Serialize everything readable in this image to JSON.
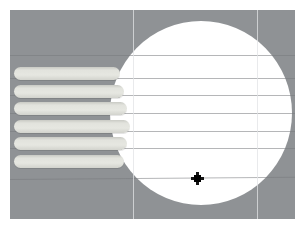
{
  "app": {
    "title": "3D Modeling Viewport",
    "view_label": "Front"
  },
  "viewport": {
    "background_color": "#8f9295",
    "surface_color": "#ffffff",
    "width": 303,
    "height": 228
  },
  "model": {
    "name": "cylindrical-body-with-ribs",
    "body": {
      "name": "circular-face",
      "shape": "circle",
      "fill_color": "#ffffff",
      "center_x": 201,
      "center_y": 113,
      "radius": 91
    },
    "ribs": [
      {
        "label": "rib-1",
        "x": 14,
        "y": 67,
        "width": 106,
        "shadow_width": 0
      },
      {
        "label": "rib-2",
        "x": 14,
        "y": 85,
        "width": 110,
        "shadow_width": 10
      },
      {
        "label": "rib-3",
        "x": 14,
        "y": 102,
        "width": 113,
        "shadow_width": 20
      },
      {
        "label": "rib-4",
        "x": 14,
        "y": 120,
        "width": 116,
        "shadow_width": 30
      },
      {
        "label": "rib-5",
        "x": 14,
        "y": 137,
        "width": 113,
        "shadow_width": 22
      },
      {
        "label": "rib-6",
        "x": 14,
        "y": 155,
        "width": 110,
        "shadow_width": 12
      }
    ],
    "rib_fill_color": "#e4e5df",
    "rib_edge_color": "#c9cac4"
  },
  "grid": {
    "enabled": true,
    "line_color": "#8a8d91",
    "horizontal_lines": [
      {
        "label": "grid-h-1",
        "y": 55
      },
      {
        "label": "grid-h-2",
        "y": 78
      },
      {
        "label": "grid-h-3",
        "y": 95
      },
      {
        "label": "grid-h-4",
        "y": 113
      },
      {
        "label": "grid-h-5",
        "y": 131
      },
      {
        "label": "grid-h-6",
        "y": 148
      },
      {
        "label": "grid-h-7",
        "y": 178
      }
    ],
    "vertical_lines": [
      {
        "label": "grid-v-1",
        "x": 133
      },
      {
        "label": "grid-v-2",
        "x": 257
      }
    ]
  },
  "cursor": {
    "type": "crosshair",
    "x": 197,
    "y": 178,
    "color": "#000000"
  }
}
